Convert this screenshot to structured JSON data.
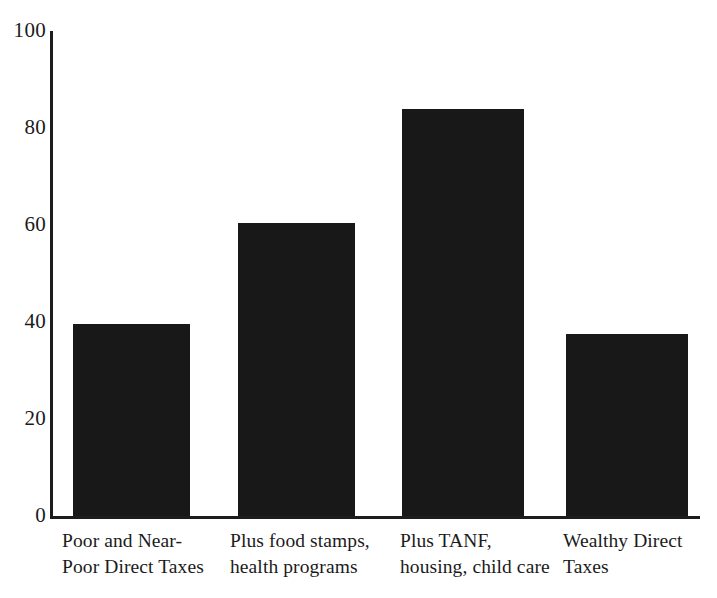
{
  "chart_data": {
    "type": "bar",
    "title": "",
    "subtitle": "",
    "xlabel": "",
    "ylabel": "",
    "ylim": [
      0,
      100
    ],
    "yticks": [
      0,
      20,
      40,
      60,
      80,
      100
    ],
    "ytick_labels": [
      "0",
      "20",
      "40",
      "60",
      "80",
      "100"
    ],
    "grid": false,
    "legend": null,
    "bar_color": "#181818",
    "axis_color": "#1c1c1c",
    "background": "#ffffff",
    "categories": [
      "Poor and Near-Poor Direct Taxes",
      "Plus food stamps, health programs",
      "Plus TANF, housing, child care",
      "Wealthy Direct Taxes"
    ],
    "category_lines": [
      [
        "Poor and Near-",
        "Poor Direct Taxes"
      ],
      [
        "Plus food stamps,",
        "health programs"
      ],
      [
        "Plus TANF,",
        "housing, child care"
      ],
      [
        "Wealthy Direct",
        "Taxes"
      ]
    ],
    "values": [
      39.5,
      60.5,
      84,
      37.5
    ]
  },
  "bars": [
    {
      "name": "bar-poor-near-poor-direct-taxes",
      "left": 73,
      "width": 117,
      "value": 39.5
    },
    {
      "name": "bar-plus-food-stamps-health-programs",
      "left": 238,
      "width": 117,
      "value": 60.5
    },
    {
      "name": "bar-plus-tanf-housing-child-care",
      "left": 402,
      "width": 122,
      "value": 84
    },
    {
      "name": "bar-wealthy-direct-taxes",
      "left": 566,
      "width": 122,
      "value": 37.5
    }
  ],
  "x_label_positions": [
    62,
    230,
    400,
    563
  ]
}
